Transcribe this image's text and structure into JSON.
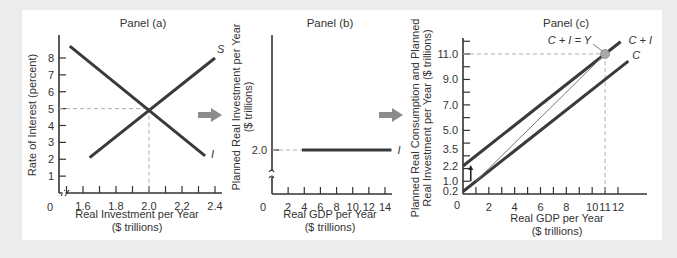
{
  "colors": {
    "curve": "#3a3a3a",
    "axis": "#333333",
    "dashed": "#b0b0b0",
    "arrow": "#8c8c8c",
    "point": "#a8a8a8",
    "thin_line": "#777777"
  },
  "chart_data": [
    {
      "type": "line",
      "title": "Panel (a)",
      "xlabel": "Real Investment per Year",
      "xlabel2": "($ trillions)",
      "ylabel": "Rate of Interest (percent)",
      "origin_label": "0",
      "xlim": [
        1.5,
        2.45
      ],
      "ylim": [
        0,
        9
      ],
      "x_axis_break": true,
      "x_ticks": [
        1.5,
        1.6,
        1.7,
        1.8,
        1.9,
        2.0,
        2.1,
        2.2,
        2.3,
        2.4
      ],
      "x_tick_labels": [
        {
          "value": 1.6,
          "label": "1.6"
        },
        {
          "value": 1.8,
          "label": "1.8"
        },
        {
          "value": 2.0,
          "label": "2.0"
        },
        {
          "value": 2.2,
          "label": "2.2"
        },
        {
          "value": 2.4,
          "label": "2.4"
        }
      ],
      "y_ticks": [
        1,
        2,
        3,
        4,
        5,
        6,
        7,
        8
      ],
      "y_tick_labels": [
        {
          "value": 1,
          "label": "1"
        },
        {
          "value": 2,
          "label": "2"
        },
        {
          "value": 3,
          "label": "3"
        },
        {
          "value": 4,
          "label": "4"
        },
        {
          "value": 5,
          "label": "5"
        },
        {
          "value": 6,
          "label": "6"
        },
        {
          "value": 7,
          "label": "7"
        },
        {
          "value": 8,
          "label": "8"
        }
      ],
      "series": [
        {
          "name": "I",
          "label": "I",
          "points": [
            [
              1.52,
              8.7
            ],
            [
              2.34,
              2.2
            ]
          ]
        },
        {
          "name": "S",
          "label": "S",
          "points": [
            [
              1.64,
              2.1
            ],
            [
              2.4,
              8.0
            ]
          ]
        }
      ],
      "equilibrium": {
        "x": 2.0,
        "y": 5
      }
    },
    {
      "type": "line",
      "title": "Panel (b)",
      "xlabel": "Real GDP per Year",
      "xlabel2": "($ trillions)",
      "ylabel": "Planned Real Investment per Year",
      "ylabel2": "($ trillions)",
      "origin_label": "0",
      "xlim": [
        0,
        15
      ],
      "ylim": [
        0,
        4.0
      ],
      "y_axis_break": true,
      "x_ticks": [
        2,
        4,
        6,
        8,
        10,
        12,
        14
      ],
      "x_tick_labels": [
        {
          "value": 2,
          "label": "2"
        },
        {
          "value": 4,
          "label": "4"
        },
        {
          "value": 6,
          "label": "6"
        },
        {
          "value": 8,
          "label": "8"
        },
        {
          "value": 10,
          "label": "10"
        },
        {
          "value": 12,
          "label": "12"
        },
        {
          "value": 14,
          "label": "14"
        }
      ],
      "y_ticks": [
        2.0
      ],
      "y_tick_labels": [
        {
          "value": 2.0,
          "label": "2.0"
        }
      ],
      "series": [
        {
          "name": "I",
          "label": "I",
          "points": [
            [
              3.7,
              2.0
            ],
            [
              14.8,
              2.0
            ]
          ]
        }
      ],
      "reference": {
        "y": 2.0,
        "x_from": 0,
        "x_to": 3.7
      }
    },
    {
      "type": "line",
      "title": "Panel (c)",
      "xlabel": "Real GDP per Year",
      "xlabel2": "($ trillions)",
      "ylabel": "Planned Real Consumption and Planned",
      "ylabel2": "Real Investment per Year ($ trillions)",
      "origin_label": "0",
      "xlim": [
        0,
        14
      ],
      "ylim": [
        0,
        12.3
      ],
      "x_ticks": [
        1,
        2,
        3,
        4,
        5,
        6,
        7,
        8,
        9,
        10,
        11,
        12
      ],
      "x_tick_labels": [
        {
          "value": 2,
          "label": "2"
        },
        {
          "value": 4,
          "label": "4"
        },
        {
          "value": 6,
          "label": "6"
        },
        {
          "value": 8,
          "label": "8"
        },
        {
          "value": 10,
          "label": "10"
        },
        {
          "value": 11,
          "label": "11"
        },
        {
          "value": 12,
          "label": "12"
        }
      ],
      "y_ticks": [
        1,
        2,
        3,
        4,
        5,
        6,
        7,
        8,
        9,
        10,
        11,
        12
      ],
      "y_tick_labels": [
        {
          "value": 0.2,
          "label": "0.2"
        },
        {
          "value": 1.0,
          "label": "1.0"
        },
        {
          "value": 2.2,
          "label": "2.2"
        },
        {
          "value": 3.5,
          "label": "3.5"
        },
        {
          "value": 5.0,
          "label": "5.0"
        },
        {
          "value": 7.0,
          "label": "7.0"
        },
        {
          "value": 9.0,
          "label": "9.0"
        },
        {
          "value": 11.0,
          "label": "11.0"
        }
      ],
      "series": [
        {
          "name": "C+I",
          "label": "C + I",
          "points": [
            [
              0,
              2.2
            ],
            [
              12.2,
              11.96
            ]
          ]
        },
        {
          "name": "C",
          "label": "C",
          "points": [
            [
              0,
              0.2
            ],
            [
              12.8,
              10.44
            ]
          ]
        },
        {
          "name": "Y",
          "label": "",
          "points": [
            [
              1.0,
              1.0
            ],
            [
              11,
              11
            ]
          ]
        }
      ],
      "equilibrium": {
        "x": 11,
        "y": 11,
        "label": "C + I = Y"
      },
      "shift_arrow": {
        "x": 0.6,
        "from": 1.0,
        "to": 2.2
      }
    }
  ]
}
